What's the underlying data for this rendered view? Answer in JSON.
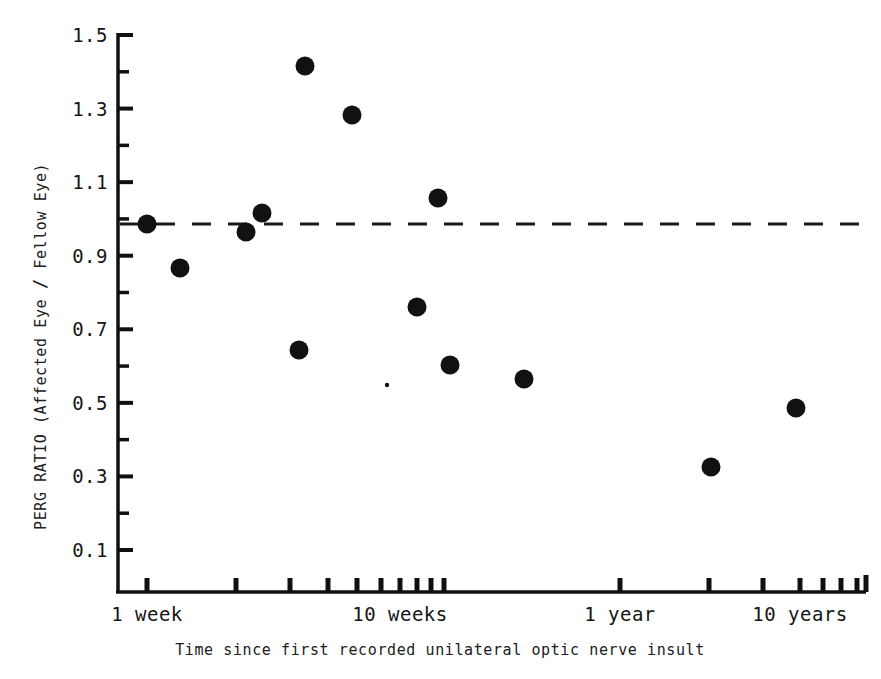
{
  "chart_data": {
    "type": "scatter",
    "title": "",
    "xlabel": "Time since first recorded unilateral optic  nerve insult",
    "ylabel": "PERG RATIO  (Affected Eye / Fellow Eye)",
    "ylabel_parts": {
      "prefix": "PERG RATIO  (Affected Eye ",
      "slash": "/",
      "suffix": " Fellow Eye)"
    },
    "xscale": "log",
    "yscale": "linear",
    "ylim": [
      0.0,
      1.55
    ],
    "grid": false,
    "legend": null,
    "ytick_labels": [
      "0.1",
      "0.3",
      "0.5",
      "0.7",
      "0.9",
      "1.1",
      "1.3",
      "1.5"
    ],
    "ytick_values": [
      0.1,
      0.3,
      0.5,
      0.7,
      0.9,
      1.1,
      1.3,
      1.5
    ],
    "yminor_values": [
      0.2,
      0.4,
      0.6,
      0.8,
      1.0,
      1.2,
      1.4
    ],
    "xtick_labels": [
      "1 week",
      "10 weeks",
      "1 year",
      "10 years"
    ],
    "xtick_label_positions": [
      147,
      400,
      620,
      800
    ],
    "xtick_positions": [
      147,
      236,
      290,
      328,
      357,
      381,
      400,
      417,
      431,
      444,
      620,
      709,
      763,
      800,
      823,
      841,
      857
    ],
    "reference_line": {
      "label": "unity ratio",
      "value": 1.0,
      "style": "dashed"
    },
    "points": [
      {
        "x_px": 147,
        "y_px": 224,
        "value": 1.0
      },
      {
        "x_px": 180,
        "y_px": 268,
        "value": 0.88
      },
      {
        "x_px": 246,
        "y_px": 232,
        "value": 0.97
      },
      {
        "x_px": 262,
        "y_px": 213,
        "value": 1.03
      },
      {
        "x_px": 305,
        "y_px": 66,
        "value": 1.42
      },
      {
        "x_px": 352,
        "y_px": 115,
        "value": 1.29
      },
      {
        "x_px": 299,
        "y_px": 350,
        "value": 0.65
      },
      {
        "x_px": 438,
        "y_px": 198,
        "value": 1.06
      },
      {
        "x_px": 417,
        "y_px": 307,
        "value": 0.77
      },
      {
        "x_px": 450,
        "y_px": 365,
        "value": 0.61
      },
      {
        "x_px": 524,
        "y_px": 379,
        "value": 0.57
      },
      {
        "x_px": 711,
        "y_px": 467,
        "value": 0.34
      },
      {
        "x_px": 796,
        "y_px": 408,
        "value": 0.51
      },
      {
        "x_px": 387,
        "y_px": 385,
        "value": 0.55
      }
    ],
    "values": [
      1.0,
      0.88,
      0.97,
      1.03,
      1.42,
      1.29,
      0.65,
      1.06,
      0.77,
      0.61,
      0.57,
      0.34,
      0.51,
      0.55
    ]
  },
  "colors": {
    "marker": "#111111",
    "axis": "#101010",
    "background": "#ffffff",
    "reference_line": "#1a1a1a"
  }
}
